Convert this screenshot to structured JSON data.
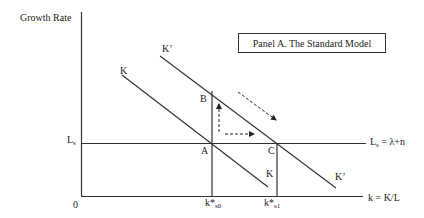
{
  "diagram": {
    "title": "Panel A. The Standard Model",
    "y_axis_label": "Growth Rate",
    "x_axis_label": "k = K/L",
    "origin_label": "0",
    "ls_left_label": "L",
    "ls_left_sub": "s",
    "ls_right_label": "L",
    "ls_right_sub": "s",
    "ls_right_eq": " = λ+n",
    "curves": {
      "k_top_label": "K",
      "k_bottom_label": "K",
      "kprime_top_label": "K’",
      "kprime_bottom_label": "K’"
    },
    "points": {
      "a": "A",
      "b": "B",
      "c": "C"
    },
    "x_ticks": {
      "k0_main": "k*",
      "k0_sub": "s0",
      "k1_main": "k*",
      "k1_sub": "s1"
    },
    "colors": {
      "line": "#333333",
      "background": "#ffffff"
    }
  }
}
